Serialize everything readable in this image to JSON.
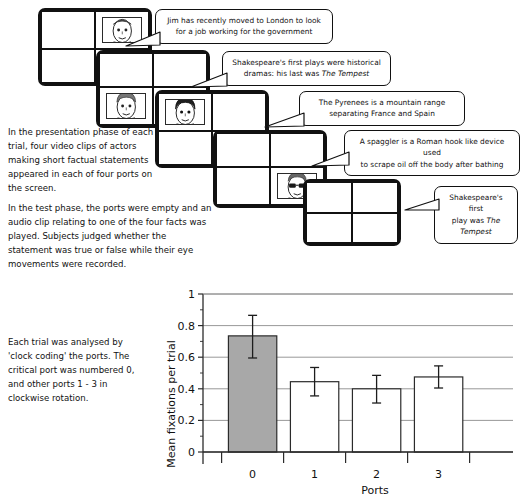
{
  "figure": {
    "port_screens": [
      {
        "id": "screen-1",
        "face_cell": 1,
        "face_type": "plain-face",
        "empty": false
      },
      {
        "id": "screen-2",
        "face_cell": 2,
        "face_type": "short-hair-face",
        "empty": false
      },
      {
        "id": "screen-3",
        "face_cell": 0,
        "face_type": "dark-hair-face",
        "empty": false
      },
      {
        "id": "screen-4",
        "face_cell": 3,
        "face_type": "sunglasses-face",
        "empty": false
      },
      {
        "id": "screen-5",
        "face_cell": -1,
        "face_type": "none",
        "empty": true
      }
    ],
    "bubbles": [
      {
        "id": "bubble-1",
        "lines": [
          {
            "text": "Jim has recently moved to London to look",
            "italic_tail": ""
          },
          {
            "text": "for a job working for the government",
            "italic_tail": ""
          }
        ]
      },
      {
        "id": "bubble-2",
        "lines": [
          {
            "text": "Shakespeare's first plays were historical",
            "italic_tail": ""
          },
          {
            "text": "dramas: his last was ",
            "italic_tail": "The Tempest"
          }
        ]
      },
      {
        "id": "bubble-3",
        "lines": [
          {
            "text": "The Pyrenees is a mountain range",
            "italic_tail": ""
          },
          {
            "text": "separating France and Spain",
            "italic_tail": ""
          }
        ]
      },
      {
        "id": "bubble-4",
        "lines": [
          {
            "text": "A spaggler is a Roman hook like device used",
            "italic_tail": ""
          },
          {
            "text": "to scrape oil off the body after bathing",
            "italic_tail": ""
          }
        ]
      },
      {
        "id": "bubble-5",
        "lines": [
          {
            "text": "Shakespeare's first",
            "italic_tail": ""
          },
          {
            "text": "play was ",
            "italic_tail": "The Tempest"
          }
        ]
      }
    ],
    "paragraphs": {
      "presentation_phase": "In the presentation phase of each trial, four video clips of actors making short factual statements appeared in each of four ports on the screen.",
      "test_phase": "In the test phase, the ports were empty and an audio clip relating to one of the four facts was played. Subjects judged whether the statement was true or false while their eye movements were recorded.",
      "analysis": "Each trial was analysed by 'clock coding' the ports. The critical port was numbered 0, and other ports 1 - 3 in clockwise rotation."
    },
    "colors": {
      "critical_bar_fill": "#a8a8a8",
      "other_bar_fill": "#ffffff",
      "line": "#2b2b2b",
      "grid": "#8c8c8c"
    }
  },
  "chart_data": {
    "type": "bar",
    "title": "",
    "xlabel": "Ports",
    "ylabel": "Mean fixations per trial",
    "categories": [
      "0",
      "1",
      "2",
      "3"
    ],
    "values": [
      0.735,
      0.445,
      0.4,
      0.475
    ],
    "errors_low": [
      0.595,
      0.355,
      0.31,
      0.405
    ],
    "errors_high": [
      0.865,
      0.535,
      0.485,
      0.545
    ],
    "bar_fills": [
      "#a8a8a8",
      "#ffffff",
      "#ffffff",
      "#ffffff"
    ],
    "ylim": [
      0,
      1
    ],
    "yticks": [
      0,
      0.2,
      0.4,
      0.6,
      0.8,
      1
    ],
    "ytick_labels": [
      "0",
      "0.2",
      "0.4",
      "0.6",
      "0.8",
      "1"
    ],
    "yminor_step": 0.1,
    "grid": "horizontal",
    "legend": "none"
  }
}
